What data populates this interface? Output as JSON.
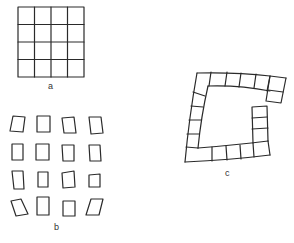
{
  "panels": [
    {
      "id": "a",
      "label": "a",
      "description": "Regular 4x4 square grid"
    },
    {
      "id": "b",
      "label": "b",
      "description": "4x4 array of individually distorted separated squares"
    },
    {
      "id": "c",
      "label": "c",
      "description": "Curved C-shaped chain of squares"
    }
  ],
  "colors": {
    "stroke": "#2a2a2a",
    "background": "#ffffff"
  }
}
